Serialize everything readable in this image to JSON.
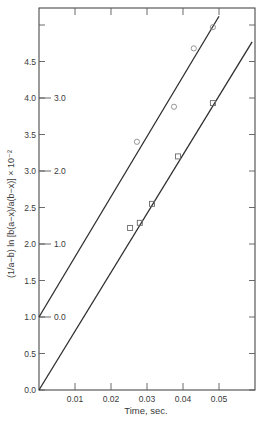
{
  "chart_data": {
    "type": "scatter",
    "title": "",
    "xlabel": "Time, sec.",
    "ylabel": "(1/a−b) ln [b(a−x)/a(b−x)] × 10⁻²",
    "xlim": [
      0,
      0.06
    ],
    "ylim": [
      0,
      5.2
    ],
    "grid": false,
    "legend": null,
    "x_ticks": [
      0.01,
      0.02,
      0.03,
      0.04,
      0.05
    ],
    "x_tick_labels": [
      "0.01",
      "0.02",
      "0.03",
      "0.04",
      "0.05"
    ],
    "y_ticks": [
      0.0,
      0.5,
      1.0,
      1.5,
      2.0,
      2.5,
      3.0,
      3.5,
      4.0,
      4.5
    ],
    "y_tick_labels": [
      "0.0",
      "0.5",
      "1.0",
      "1.5",
      "2.0",
      "2.5",
      "3.0",
      "3.5",
      "4.0",
      "4.5"
    ],
    "secondary_y_ticks": [
      {
        "at": 1.0,
        "label": "0.0"
      },
      {
        "at": 2.0,
        "label": "1.0"
      },
      {
        "at": 3.0,
        "label": "2.0"
      },
      {
        "at": 4.0,
        "label": "3.0"
      }
    ],
    "series": [
      {
        "name": "circles (offset +1.0, read on inner scale)",
        "marker": "circle",
        "x": [
          0.0272,
          0.0375,
          0.043,
          0.0483
        ],
        "y": [
          3.4,
          3.88,
          4.68,
          4.97
        ],
        "fit_line": {
          "x": [
            0.0,
            0.05
          ],
          "y": [
            1.0,
            5.12
          ]
        }
      },
      {
        "name": "squares",
        "marker": "square",
        "x": [
          0.0253,
          0.028,
          0.0314,
          0.0386,
          0.0483
        ],
        "y": [
          2.22,
          2.29,
          2.55,
          3.2,
          3.93
        ],
        "fit_line": {
          "x": [
            0.0,
            0.0592
          ],
          "y": [
            0.0,
            4.77
          ]
        }
      }
    ]
  },
  "labels": {
    "xlabel": "Time, sec.",
    "ylabel": "(1/a−b) ln [b(a−x)/a(b−x)] × 10⁻²"
  }
}
